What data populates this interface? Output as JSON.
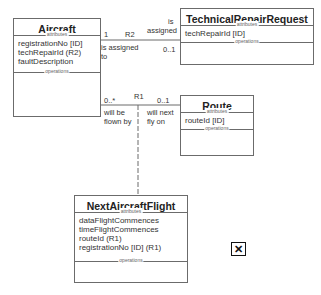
{
  "diagram": {
    "classes": [
      {
        "name": "Aircraft",
        "attributes_label": "attributes",
        "attributes": [
          "registrationNo [ID]",
          "techRepairId (R2)",
          "faultDescription"
        ],
        "operations_label": "operations"
      },
      {
        "name": "TechnicalRepairRequest",
        "attributes_label": "attributes",
        "attributes": [
          "techRepairId [ID]"
        ],
        "operations_label": "operations"
      },
      {
        "name": "Route",
        "attributes_label": "attributes",
        "attributes": [
          "routeId [ID]"
        ],
        "operations_label": "operations"
      },
      {
        "name": "NextAircraftFlight",
        "attributes_label": "attributes",
        "attributes": [
          "dataFlightCommences",
          "timeFlightCommences",
          "routeId (R1)",
          "registrationNo [ID] (R1)"
        ],
        "operations_label": "operations"
      }
    ],
    "associations": [
      {
        "id": "R2",
        "from_multiplicity": "1",
        "to_multiplicity": "0..1",
        "from_phrase": "is assigned to",
        "to_phrase_line1": "is",
        "to_phrase_line2": "assigned",
        "from_phrase_line1": "is assigned",
        "from_phrase_line2": "to"
      },
      {
        "id": "R1",
        "from_multiplicity": "0..*",
        "to_multiplicity": "0..1",
        "from_phrase_line1": "will be",
        "from_phrase_line2": "flown by",
        "to_phrase_line1": "will next",
        "to_phrase_line2": "fly on"
      }
    ],
    "close_icon": "close-icon"
  }
}
